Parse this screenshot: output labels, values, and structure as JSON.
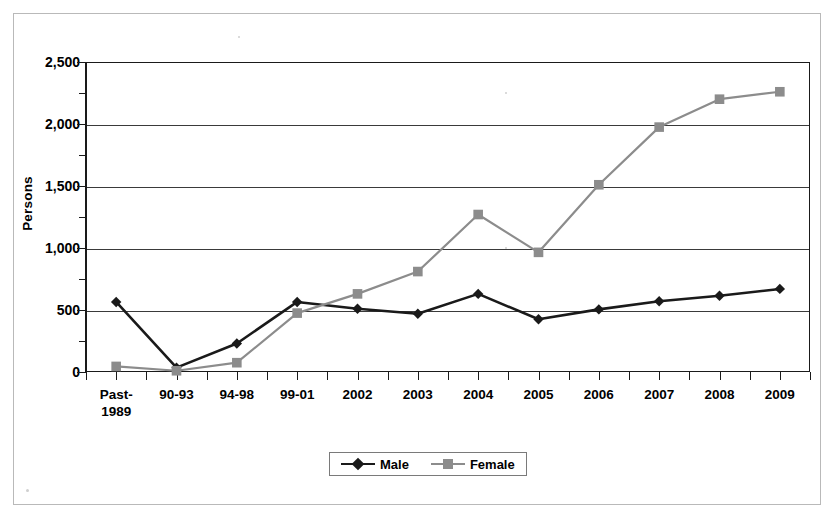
{
  "chart_data": {
    "type": "line",
    "title": "",
    "xlabel": "",
    "ylabel": "Persons",
    "ylim": [
      0,
      2500
    ],
    "ytick_step": 500,
    "yticks": [
      "0",
      "500",
      "1,000",
      "1,500",
      "2,000",
      "2,500"
    ],
    "ytick_values": [
      0,
      500,
      1000,
      1500,
      2000,
      2500
    ],
    "grid": true,
    "legend_position": "bottom-center",
    "categories": [
      "Past-\n1989",
      "90-93",
      "94-98",
      "99-01",
      "2002",
      "2003",
      "2004",
      "2005",
      "2006",
      "2007",
      "2008",
      "2009"
    ],
    "series": [
      {
        "name": "Male",
        "color": "#1a1a1a",
        "marker": "diamond",
        "values": [
          565,
          35,
          230,
          565,
          510,
          470,
          630,
          425,
          505,
          570,
          615,
          670
        ]
      },
      {
        "name": "Female",
        "color": "#8c8c8c",
        "marker": "square",
        "values": [
          45,
          10,
          75,
          475,
          630,
          810,
          1270,
          965,
          1510,
          1975,
          2200,
          2260
        ]
      }
    ]
  },
  "legend": {
    "items": [
      {
        "label": "Male"
      },
      {
        "label": "Female"
      }
    ]
  },
  "axis": {
    "y_title": "Persons"
  }
}
